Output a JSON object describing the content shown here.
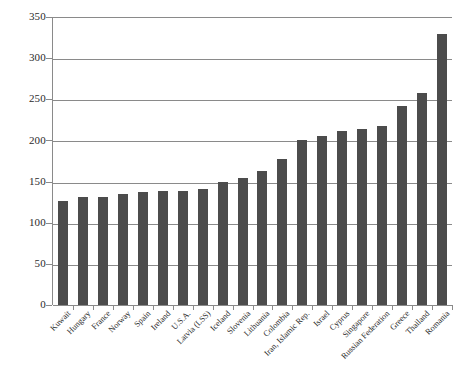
{
  "chart_data": {
    "type": "bar",
    "title": "",
    "subtitle": "",
    "xlabel": "",
    "ylabel": "",
    "ylim": [
      0,
      350
    ],
    "ytick_step": 50,
    "yticks": [
      0,
      50,
      100,
      150,
      200,
      250,
      300,
      350
    ],
    "grid": "horizontal",
    "legend": "none",
    "bar_color": "#4c4c4c",
    "axis_color": "#8a8a8a",
    "categories": [
      "Kuwait",
      "Hungary",
      "France",
      "Norway",
      "Spain",
      "Ireland",
      "U.S.A.",
      "Latvia (LSS)",
      "Iceland",
      "Slovenia",
      "Lithuania",
      "Colombia",
      "Iran, Islamic Rep.",
      "Israel",
      "Cyprus",
      "Singapore",
      "Russian Federation",
      "Greece",
      "Thailand",
      "Romania"
    ],
    "values": [
      126,
      131,
      131,
      135,
      137,
      138,
      139,
      141,
      150,
      154,
      163,
      178,
      200,
      205,
      211,
      214,
      218,
      242,
      258,
      329
    ],
    "series": [
      {
        "name": "value",
        "values": [
          126,
          131,
          131,
          135,
          137,
          138,
          139,
          141,
          150,
          154,
          163,
          178,
          200,
          205,
          211,
          214,
          218,
          242,
          258,
          329
        ]
      }
    ]
  }
}
